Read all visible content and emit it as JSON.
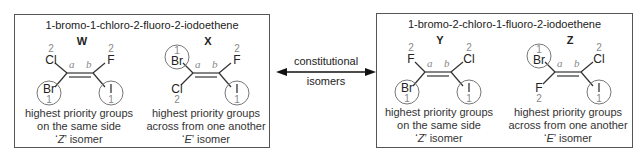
{
  "left_panel": {
    "title": "1-bromo-1-chloro-2-fluoro-2-iodoethene",
    "molecules": [
      {
        "letter": "W",
        "carbon_a": {
          "label": "a",
          "top": {
            "atom": "Cl",
            "priority": "2"
          },
          "bottom": {
            "atom": "Br",
            "priority": "1",
            "circled": true
          }
        },
        "carbon_b": {
          "label": "b",
          "top": {
            "atom": "F",
            "priority": "2"
          },
          "bottom": {
            "atom": "I",
            "priority": "1",
            "circled": true
          }
        },
        "desc_line1": "highest priority groups",
        "desc_line2": "on the same side",
        "isomer_letter": "Z",
        "isomer_suffix": " isomer"
      },
      {
        "letter": "X",
        "carbon_a": {
          "label": "a",
          "top": {
            "atom": "Br",
            "priority": "1",
            "circled": true
          },
          "bottom": {
            "atom": "Cl",
            "priority": "2"
          }
        },
        "carbon_b": {
          "label": "b",
          "top": {
            "atom": "F",
            "priority": "2"
          },
          "bottom": {
            "atom": "I",
            "priority": "1",
            "circled": true
          }
        },
        "desc_line1": "highest priority groups",
        "desc_line2": "across from one another",
        "isomer_letter": "E",
        "isomer_suffix": " isomer"
      }
    ]
  },
  "center": {
    "arrow_label_top": "constitutional",
    "arrow_label_bottom": "isomers"
  },
  "right_panel": {
    "title": "1-bromo-2-chloro-1-fluoro-2-iodoethene",
    "molecules": [
      {
        "letter": "Y",
        "carbon_a": {
          "label": "a",
          "top": {
            "atom": "F",
            "priority": "2"
          },
          "bottom": {
            "atom": "Br",
            "priority": "1",
            "circled": true
          }
        },
        "carbon_b": {
          "label": "b",
          "top": {
            "atom": "Cl",
            "priority": "2"
          },
          "bottom": {
            "atom": "I",
            "priority": "1",
            "circled": true
          }
        },
        "desc_line1": "highest priority groups",
        "desc_line2": "on the same side",
        "isomer_letter": "Z",
        "isomer_suffix": " isomer"
      },
      {
        "letter": "Z",
        "carbon_a": {
          "label": "a",
          "top": {
            "atom": "Br",
            "priority": "1",
            "circled": true
          },
          "bottom": {
            "atom": "F",
            "priority": "2"
          }
        },
        "carbon_b": {
          "label": "b",
          "top": {
            "atom": "Cl",
            "priority": "2"
          },
          "bottom": {
            "atom": "I",
            "priority": "1",
            "circled": true
          }
        },
        "desc_line1": "highest priority groups",
        "desc_line2": "across from one another",
        "isomer_letter": "E",
        "isomer_suffix": " isomer"
      }
    ]
  },
  "colors": {
    "border": "#555555",
    "text": "#222222",
    "priority_gray": "#888888",
    "circle": "#777777"
  }
}
